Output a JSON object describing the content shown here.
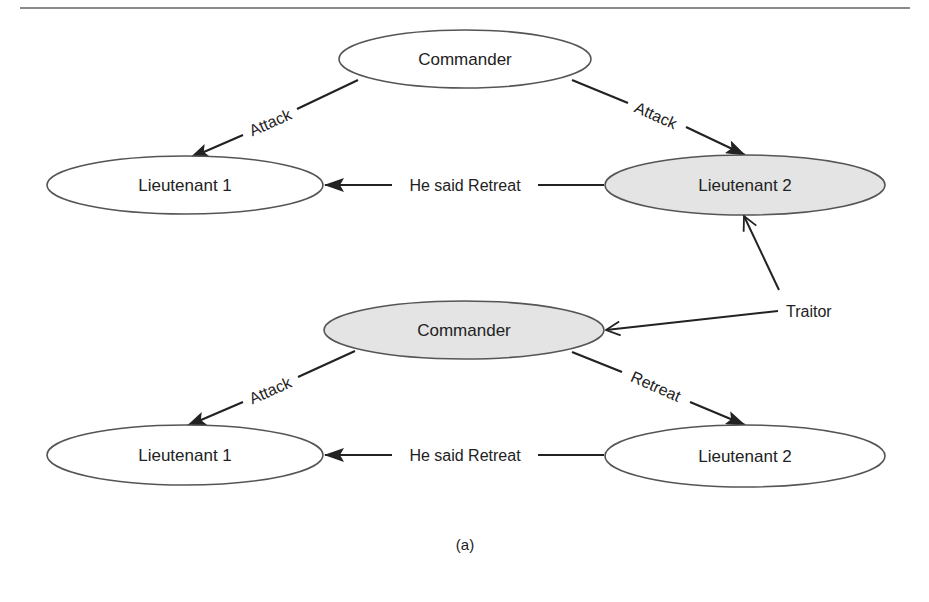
{
  "colors": {
    "rule": "#8a8a8a",
    "node_stroke": "#555555",
    "node_fill_normal": "#ffffff",
    "node_fill_highlighted": "#e4e4e4",
    "edge": "#222222",
    "text": "#222222"
  },
  "diagram": {
    "top": {
      "commander": {
        "label": "Commander",
        "highlighted": false
      },
      "lieutenant1": {
        "label": "Lieutenant 1",
        "highlighted": false
      },
      "lieutenant2": {
        "label": "Lieutenant 2",
        "highlighted": true
      },
      "edges": [
        {
          "from": "Commander",
          "to": "Lieutenant 1",
          "label": "Attack"
        },
        {
          "from": "Commander",
          "to": "Lieutenant 2",
          "label": "Attack"
        },
        {
          "from": "Lieutenant 2",
          "to": "Lieutenant 1",
          "label": "He said Retreat"
        }
      ]
    },
    "bottom": {
      "commander": {
        "label": "Commander",
        "highlighted": true
      },
      "lieutenant1": {
        "label": "Lieutenant 1",
        "highlighted": false
      },
      "lieutenant2": {
        "label": "Lieutenant 2",
        "highlighted": false
      },
      "edges": [
        {
          "from": "Commander",
          "to": "Lieutenant 1",
          "label": "Attack"
        },
        {
          "from": "Commander",
          "to": "Lieutenant 2",
          "label": "Retreat"
        },
        {
          "from": "Lieutenant 2",
          "to": "Lieutenant 1",
          "label": "He said Retreat"
        }
      ]
    },
    "annotation": {
      "label": "Traitor",
      "points_to": [
        "Lieutenant 2 (top)",
        "Commander (bottom)"
      ]
    },
    "caption": "(a)"
  }
}
